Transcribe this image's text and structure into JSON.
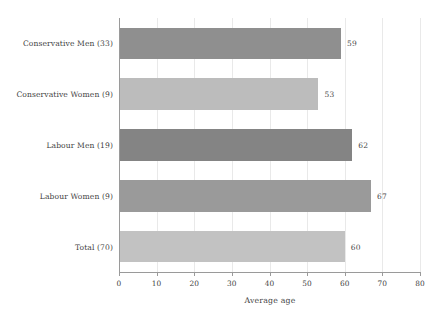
{
  "chart_data": {
    "type": "bar",
    "orientation": "horizontal",
    "title": "",
    "xlabel": "Average age",
    "ylabel": "",
    "categories": [
      "Conservative Men (33)",
      "Conservative Women (9)",
      "Labour Men (19)",
      "Labour Women (9)",
      "Total (70)"
    ],
    "values": [
      59,
      53,
      62,
      67,
      60
    ],
    "value_labels": [
      "59",
      "53",
      "62",
      "67",
      "60"
    ],
    "bar_colors": [
      "#8f8f8f",
      "#bcbcbc",
      "#848484",
      "#9a9a9a",
      "#c2c2c2"
    ],
    "xlim": [
      0,
      80
    ],
    "xticks": [
      0,
      10,
      20,
      30,
      40,
      50,
      60,
      70,
      80
    ],
    "xtick_labels": [
      "0",
      "10",
      "20",
      "30",
      "40",
      "50",
      "60",
      "70",
      "80"
    ],
    "grid": "vertical-only",
    "legend": "none"
  },
  "colors": {
    "background": "#ffffff",
    "axis": "#9a9a9a",
    "gridline": "#e9e9e9",
    "text": "#3f3f3f",
    "bar_dark": "#8f8f8f",
    "bar_light": "#bcbcbc"
  }
}
